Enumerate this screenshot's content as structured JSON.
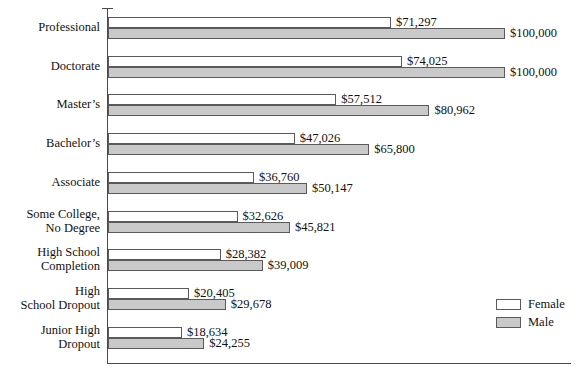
{
  "chart_data": {
    "type": "bar",
    "orientation": "horizontal",
    "title": "",
    "xlabel": "",
    "ylabel": "",
    "grid": false,
    "xlim": [
      0,
      100000
    ],
    "legend_position": "bottom-right",
    "categories": [
      "Professional",
      "Doctorate",
      "Master’s",
      "Bachelor’s",
      "Associate",
      "Some College,\nNo Degree",
      "High School\nCompletion",
      "High\nSchool Dropout",
      "Junior High\nDropout"
    ],
    "series": [
      {
        "name": "Female",
        "color": "#ffffff",
        "values": [
          71297,
          74025,
          57512,
          47026,
          36760,
          32626,
          28382,
          20405,
          18634
        ],
        "labels": [
          "$71,297",
          "$74,025",
          "$57,512",
          "$47,026",
          "$36,760",
          "$32,626",
          "$28,382",
          "$20,405",
          "$18,634"
        ]
      },
      {
        "name": "Male",
        "color": "#c9c9c9",
        "values": [
          100000,
          100000,
          80962,
          65800,
          50147,
          45821,
          39009,
          29678,
          24255
        ],
        "labels": [
          "$100,000",
          "$100,000",
          "$80,962",
          "$65,800",
          "$50,147",
          "$45,821",
          "$39,009",
          "$29,678",
          "$24,255"
        ]
      }
    ]
  },
  "legend": {
    "items": [
      {
        "label": "Female",
        "swatch": "female"
      },
      {
        "label": "Male",
        "swatch": "male"
      }
    ]
  }
}
